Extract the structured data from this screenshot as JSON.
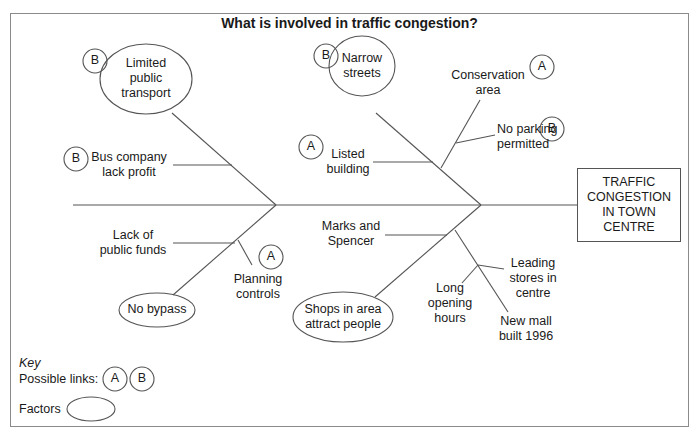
{
  "title": "What is involved in traffic congestion?",
  "effect": {
    "lines": [
      "TRAFFIC",
      "CONGESTION",
      "IN TOWN",
      "CENTRE"
    ]
  },
  "factors": {
    "limited_public_transport": {
      "lines": [
        "Limited",
        "public",
        "transport"
      ],
      "link": "B"
    },
    "narrow_streets": {
      "lines": [
        "Narrow",
        "streets"
      ],
      "link": "B"
    },
    "no_bypass": {
      "lines": [
        "No bypass"
      ]
    },
    "shops_attract": {
      "lines": [
        "Shops in area",
        "attract people"
      ]
    }
  },
  "causes": {
    "bus_company": {
      "lines": [
        "Bus company",
        "lack profit"
      ],
      "link": "B"
    },
    "lack_public_funds": {
      "lines": [
        "Lack of",
        "public funds"
      ]
    },
    "planning_controls": {
      "lines": [
        "Planning",
        "controls"
      ],
      "link": "A"
    },
    "listed_building": {
      "lines": [
        "Listed",
        "building"
      ],
      "link": "A"
    },
    "conservation_area": {
      "lines": [
        "Conservation",
        "area"
      ],
      "link": "A"
    },
    "no_parking": {
      "lines": [
        "No parking",
        "permitted"
      ],
      "link": "B"
    },
    "marks_spencer": {
      "lines": [
        "Marks and",
        "Spencer"
      ]
    },
    "leading_stores": {
      "lines": [
        "Leading",
        "stores in",
        "centre"
      ]
    },
    "long_opening": {
      "lines": [
        "Long",
        "opening",
        "hours"
      ]
    },
    "new_mall": {
      "lines": [
        "New mall",
        "built 1996"
      ]
    }
  },
  "key": {
    "title": "Key",
    "links_label": "Possible links:",
    "link_a": "A",
    "link_b": "B",
    "factors_label": "Factors"
  }
}
